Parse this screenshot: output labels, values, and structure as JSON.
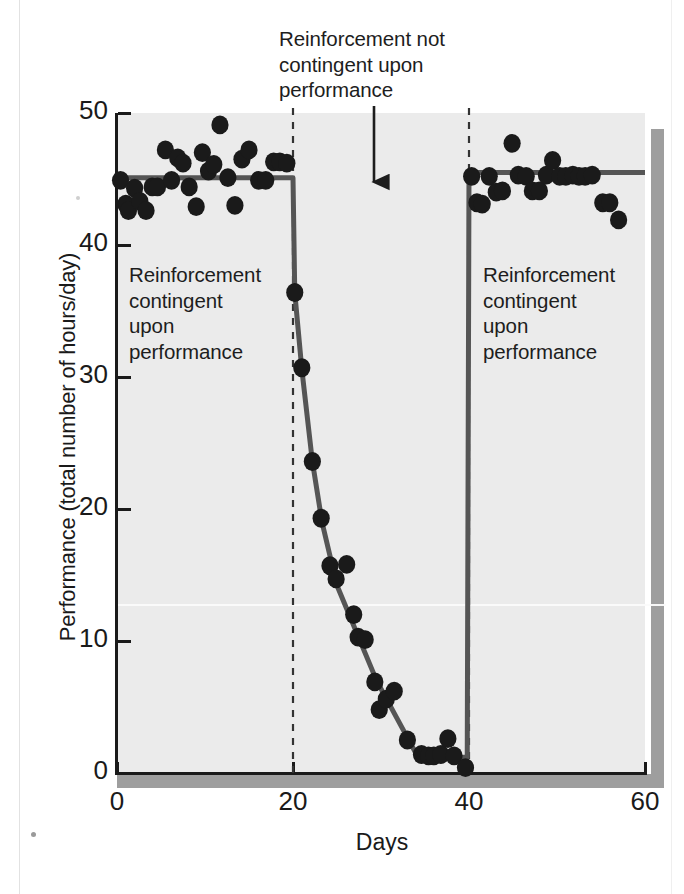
{
  "figure": {
    "top_annotation": "Reinforcement not\ncontingent upon\nperformance",
    "phase_label_1": "Reinforcement\ncontingent\nupon\nperformance",
    "phase_label_3": "Reinforcement\ncontingent\nupon\nperformance",
    "arrow_icon": "down-arrow-icon"
  },
  "colors": {
    "panel_background": "#ebebeb",
    "panel_shadow": "#9e9e9e",
    "axis": "#1a1a1a",
    "marker": "#1a1a1a",
    "trend_line": "#555555",
    "divider_dashed": "#333333",
    "page_background": "#ffffff"
  },
  "chart_data": {
    "type": "scatter",
    "title": "",
    "subtitle": "",
    "xlabel": "Days",
    "ylabel": "Performance (total number of hours/day)",
    "xlim": [
      0,
      60
    ],
    "ylim": [
      0,
      50
    ],
    "xticks": [
      0,
      20,
      40,
      60
    ],
    "yticks": [
      0,
      10,
      20,
      30,
      40,
      50
    ],
    "grid": false,
    "legend": "none",
    "annotations": [
      {
        "text": "Reinforcement not contingent upon performance",
        "x": 30,
        "y": 50,
        "arrow": "down"
      },
      {
        "text": "Reinforcement contingent upon performance",
        "x": 3,
        "y": 38
      },
      {
        "text": "Reinforcement contingent upon performance",
        "x": 42,
        "y": 38
      }
    ],
    "phase_dividers": [
      20,
      40
    ],
    "series": [
      {
        "name": "Daily performance",
        "type": "scatter",
        "points": [
          [
            0.4,
            44.9
          ],
          [
            1.0,
            43.1
          ],
          [
            1.3,
            42.6
          ],
          [
            2.0,
            44.3
          ],
          [
            2.6,
            43.3
          ],
          [
            3.3,
            42.6
          ],
          [
            4.0,
            44.4
          ],
          [
            4.6,
            44.4
          ],
          [
            5.5,
            47.2
          ],
          [
            6.2,
            44.9
          ],
          [
            6.9,
            46.6
          ],
          [
            7.5,
            46.2
          ],
          [
            8.2,
            44.4
          ],
          [
            9.0,
            42.9
          ],
          [
            9.7,
            47.0
          ],
          [
            10.4,
            45.6
          ],
          [
            11.0,
            46.1
          ],
          [
            11.7,
            49.1
          ],
          [
            12.6,
            45.1
          ],
          [
            13.4,
            43.0
          ],
          [
            14.2,
            46.5
          ],
          [
            15.0,
            47.2
          ],
          [
            16.1,
            44.9
          ],
          [
            16.9,
            44.9
          ],
          [
            17.8,
            46.3
          ],
          [
            18.5,
            46.3
          ],
          [
            19.3,
            46.2
          ],
          [
            20.2,
            36.4
          ],
          [
            21.0,
            30.7
          ],
          [
            22.2,
            23.6
          ],
          [
            23.2,
            19.3
          ],
          [
            24.2,
            15.7
          ],
          [
            24.9,
            14.7
          ],
          [
            26.1,
            15.8
          ],
          [
            26.9,
            12.0
          ],
          [
            27.4,
            10.3
          ],
          [
            28.2,
            10.1
          ],
          [
            29.3,
            6.9
          ],
          [
            29.8,
            4.8
          ],
          [
            30.6,
            5.6
          ],
          [
            31.5,
            6.2
          ],
          [
            33.0,
            2.5
          ],
          [
            34.6,
            1.4
          ],
          [
            35.4,
            1.3
          ],
          [
            36.0,
            1.3
          ],
          [
            36.8,
            1.4
          ],
          [
            37.6,
            2.6
          ],
          [
            38.3,
            1.3
          ],
          [
            39.6,
            0.4
          ],
          [
            40.3,
            45.2
          ],
          [
            40.9,
            43.2
          ],
          [
            41.5,
            43.1
          ],
          [
            42.3,
            45.2
          ],
          [
            43.1,
            44.0
          ],
          [
            43.8,
            44.1
          ],
          [
            44.9,
            47.7
          ],
          [
            45.6,
            45.3
          ],
          [
            46.5,
            45.2
          ],
          [
            47.2,
            44.1
          ],
          [
            48.0,
            44.1
          ],
          [
            48.8,
            45.3
          ],
          [
            49.5,
            46.4
          ],
          [
            50.3,
            45.2
          ],
          [
            51.0,
            45.2
          ],
          [
            51.8,
            45.3
          ],
          [
            52.5,
            45.2
          ],
          [
            53.2,
            45.2
          ],
          [
            54.0,
            45.3
          ],
          [
            55.2,
            43.2
          ],
          [
            56.0,
            43.2
          ],
          [
            57.0,
            41.9
          ]
        ]
      },
      {
        "name": "Fitted trend",
        "type": "line",
        "points": [
          [
            0,
            45.1
          ],
          [
            20,
            45.1
          ],
          [
            20.2,
            36.4
          ],
          [
            21.0,
            30.6
          ],
          [
            22.2,
            23.6
          ],
          [
            23.3,
            19.0
          ],
          [
            25.0,
            14.2
          ],
          [
            29.5,
            7.0
          ],
          [
            34.2,
            1.2
          ],
          [
            39.8,
            1.2
          ],
          [
            40.0,
            45.5
          ],
          [
            60,
            45.5
          ]
        ]
      }
    ]
  }
}
